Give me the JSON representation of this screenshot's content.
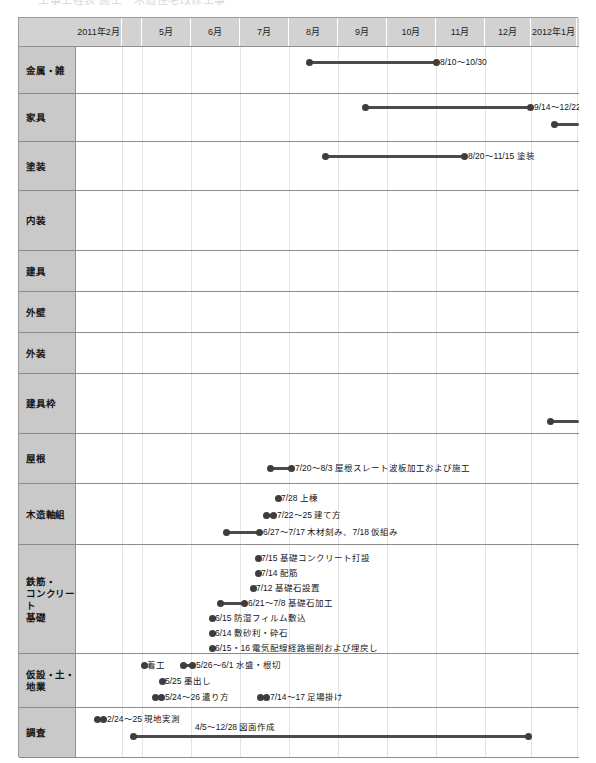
{
  "title_ghost": "工事工程表  施工　木造住宅改修工事",
  "colors": {
    "header_bg": "#d2d2d2",
    "label_bg": "#c9c9c9",
    "grid": "#e3e3e3",
    "row_border": "#8b8b8b",
    "bar": "#4a4a4a",
    "dot": "#3d3d3d",
    "text": "#161616"
  },
  "header": {
    "corner_label": "",
    "columns": [
      {
        "label_lines": [
          "2011年",
          "2月"
        ],
        "x": 57,
        "w": 46
      },
      {
        "label_lines": [
          ""
        ],
        "x": 103,
        "w": 20
      },
      {
        "label_lines": [
          "5月"
        ],
        "x": 123,
        "w": 49
      },
      {
        "label_lines": [
          "6月"
        ],
        "x": 172,
        "w": 49
      },
      {
        "label_lines": [
          "7月"
        ],
        "x": 221,
        "w": 49
      },
      {
        "label_lines": [
          "8月"
        ],
        "x": 270,
        "w": 49
      },
      {
        "label_lines": [
          "9月"
        ],
        "x": 319,
        "w": 49
      },
      {
        "label_lines": [
          "10月"
        ],
        "x": 368,
        "w": 49
      },
      {
        "label_lines": [
          "11月"
        ],
        "x": 417,
        "w": 49
      },
      {
        "label_lines": [
          "12月"
        ],
        "x": 466,
        "w": 46
      },
      {
        "label_lines": [
          "2012年",
          "1月"
        ],
        "x": 512,
        "w": 46
      }
    ]
  },
  "gridlines_x": [
    45,
    65,
    114,
    163,
    212,
    261,
    310,
    359,
    408,
    454,
    500
  ],
  "rows": [
    {
      "label": "金属・雑",
      "y": 0,
      "h": 47
    },
    {
      "label": "家具",
      "y": 47,
      "h": 48
    },
    {
      "label": "塗装",
      "y": 95,
      "h": 49
    },
    {
      "label": "内装",
      "y": 144,
      "h": 60
    },
    {
      "label": "建具",
      "y": 204,
      "h": 41
    },
    {
      "label": "外壁",
      "y": 245,
      "h": 41
    },
    {
      "label": "外装",
      "y": 286,
      "h": 41
    },
    {
      "label": "建具枠",
      "y": 327,
      "h": 60
    },
    {
      "label": "屋根",
      "y": 387,
      "h": 50
    },
    {
      "label": "木造軸組",
      "y": 437,
      "h": 61
    },
    {
      "label": "鉄筋・\nコンクリート\n基礎",
      "y": 498,
      "h": 109
    },
    {
      "label": "仮設・土・\n地業",
      "y": 607,
      "h": 54
    },
    {
      "label": "調査",
      "y": 661,
      "h": 50
    }
  ],
  "chart_data": {
    "type": "gantt",
    "title": "",
    "xlabel": "",
    "ylabel": "",
    "time_axis": {
      "start": "2011-02",
      "end": "2012-01",
      "tick_labels": [
        "2011年2月",
        "",
        "5月",
        "6月",
        "7月",
        "8月",
        "9月",
        "10月",
        "11月",
        "12月",
        "2012年1月"
      ]
    },
    "categories": [
      "金属・雑",
      "家具",
      "塗装",
      "内装",
      "建具",
      "外壁",
      "外装",
      "建具枠",
      "屋根",
      "木造軸組",
      "鉄筋・コンクリート基礎",
      "仮設・土・地業",
      "調査"
    ],
    "tasks": [
      {
        "category": "金属・雑",
        "label": "8/10〜10/30",
        "start": "8/10",
        "end": "10/30",
        "x": 232,
        "w": 128,
        "lane": 0,
        "label_side": "right",
        "clipped": false
      },
      {
        "category": "家具",
        "label": "9/14〜12/22",
        "start": "9/14",
        "end": "12/22",
        "x": 288,
        "w": 166,
        "lane": 0,
        "label_side": "right",
        "clipped": false
      },
      {
        "category": "家具",
        "label": "",
        "start": "12/26",
        "end": "",
        "x": 477,
        "w": 25,
        "lane": 1,
        "label_side": "none",
        "clipped": true
      },
      {
        "category": "塗装",
        "label": "8/20〜11/15 塗装",
        "start": "8/20",
        "end": "11/15",
        "x": 248,
        "w": 140,
        "lane": 0,
        "label_side": "right",
        "clipped": false
      },
      {
        "category": "内装",
        "label": "",
        "start": "",
        "end": "",
        "x": 0,
        "w": 0,
        "lane": 0,
        "label_side": "none",
        "clipped": false
      },
      {
        "category": "建具枠",
        "label": "",
        "start": "12/28",
        "end": "",
        "x": 473,
        "w": 29,
        "lane": 0,
        "label_side": "none",
        "clipped": true
      },
      {
        "category": "屋根",
        "label": "7/20〜8/3 屋根スレート波板加工および施工",
        "start": "7/20",
        "end": "8/3",
        "x": 193,
        "w": 22,
        "lane": 0,
        "label_side": "right",
        "clipped": false
      },
      {
        "category": "木造軸組",
        "label": "7/28 上棟",
        "start": "7/28",
        "end": "7/28",
        "x": 201,
        "w": 0,
        "lane": 0,
        "label_side": "right",
        "clipped": false
      },
      {
        "category": "木造軸組",
        "label": "7/22〜25 建て方",
        "start": "7/22",
        "end": "7/25",
        "x": 189,
        "w": 8,
        "lane": 1,
        "label_side": "right",
        "clipped": false
      },
      {
        "category": "木造軸組",
        "label": "6/27〜7/17 木材刻み、7/18 仮組み",
        "start": "6/27",
        "end": "7/17",
        "x": 149,
        "w": 34,
        "lane": 2,
        "label_side": "right",
        "clipped": false
      },
      {
        "category": "鉄筋・コンクリート基礎",
        "label": "7/15 基礎コンクリート打設",
        "start": "7/15",
        "end": "7/15",
        "x": 181,
        "w": 0,
        "lane": 0,
        "label_side": "right",
        "clipped": false
      },
      {
        "category": "鉄筋・コンクリート基礎",
        "label": "7/14 配筋",
        "start": "7/14",
        "end": "7/14",
        "x": 181,
        "w": 0,
        "lane": 1,
        "label_side": "right",
        "clipped": false
      },
      {
        "category": "鉄筋・コンクリート基礎",
        "label": "7/12 基礎石設置",
        "start": "7/12",
        "end": "7/12",
        "x": 176,
        "w": 0,
        "lane": 2,
        "label_side": "right",
        "clipped": false
      },
      {
        "category": "鉄筋・コンクリート基礎",
        "label": "6/21〜7/8 基礎石加工",
        "start": "6/21",
        "end": "7/8",
        "x": 143,
        "w": 25,
        "lane": 3,
        "label_side": "right",
        "clipped": false
      },
      {
        "category": "鉄筋・コンクリート基礎",
        "label": "6/15 防湿フィルム敷込",
        "start": "6/15",
        "end": "6/15",
        "x": 135,
        "w": 0,
        "lane": 4,
        "label_side": "right",
        "clipped": false
      },
      {
        "category": "鉄筋・コンクリート基礎",
        "label": "6/14 敷砂利・砕石",
        "start": "6/14",
        "end": "6/14",
        "x": 135,
        "w": 0,
        "lane": 5,
        "label_side": "right",
        "clipped": false
      },
      {
        "category": "鉄筋・コンクリート基礎",
        "label": "6/15・16 電気配線経路掘削および埋戻し",
        "start": "6/15",
        "end": "6/16",
        "x": 135,
        "w": 0,
        "lane": 6,
        "label_side": "right",
        "clipped": false
      },
      {
        "category": "仮設・土・地業",
        "label": "着工",
        "start": "5/23",
        "end": "5/23",
        "x": 67,
        "w": 0,
        "lane": 0,
        "label_side": "right",
        "clipped": false
      },
      {
        "category": "仮設・土・地業",
        "label": "5/26〜6/1 水盛・根切",
        "start": "5/26",
        "end": "6/1",
        "x": 106,
        "w": 10,
        "lane": 0,
        "label_side": "right",
        "clipped": false
      },
      {
        "category": "仮設・土・地業",
        "label": "5/25 墨出し",
        "start": "5/25",
        "end": "5/25",
        "x": 85,
        "w": 0,
        "lane": 1,
        "label_side": "right",
        "clipped": false
      },
      {
        "category": "仮設・土・地業",
        "label": "5/24〜26 遣り方",
        "start": "5/24",
        "end": "5/26",
        "x": 78,
        "w": 7,
        "lane": 2,
        "label_side": "right",
        "clipped": false
      },
      {
        "category": "仮設・土・地業",
        "label": "7/14〜17 足場掛け",
        "start": "7/14",
        "end": "7/17",
        "x": 183,
        "w": 7,
        "lane": 2,
        "label_side": "right",
        "clipped": false
      },
      {
        "category": "調査",
        "label": "2/24〜25 現地実測",
        "start": "2/24",
        "end": "2/25",
        "x": 20,
        "w": 7,
        "lane": 0,
        "label_side": "right",
        "clipped": false
      },
      {
        "category": "調査",
        "label": "4/5〜12/28 図面作成",
        "start": "4/5",
        "end": "12/28",
        "x": 56,
        "w": 396,
        "lane": 1,
        "label_side": "above",
        "clipped": false
      }
    ]
  }
}
